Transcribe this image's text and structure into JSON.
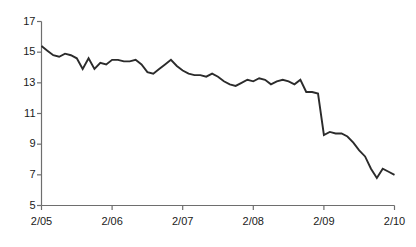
{
  "chart_data": {
    "type": "line",
    "title": "",
    "subtitle": "",
    "xlabel": "",
    "ylabel": "",
    "grid": false,
    "legend": false,
    "legend_position": "none",
    "line_color": "#2b2b2b",
    "axis_color": "#6e6e6e",
    "background_color": "#ffffff",
    "ylim": [
      5,
      17
    ],
    "ytick_labels": [
      "17",
      "15",
      "13",
      "11",
      "9",
      "7",
      "5"
    ],
    "yticks": [
      17,
      15,
      13,
      11,
      9,
      7,
      5
    ],
    "xtick_labels": [
      "2/05",
      "2/06",
      "2/07",
      "2/08",
      "2/09",
      "2/10"
    ],
    "xticks": [
      0,
      12,
      24,
      36,
      48,
      60
    ],
    "xlim": [
      0,
      60
    ],
    "series": [
      {
        "name": "value",
        "x": [
          0,
          1,
          2,
          3,
          4,
          5,
          6,
          7,
          8,
          9,
          10,
          11,
          12,
          13,
          14,
          15,
          16,
          17,
          18,
          19,
          20,
          21,
          22,
          23,
          24,
          25,
          26,
          27,
          28,
          29,
          30,
          31,
          32,
          33,
          34,
          35,
          36,
          37,
          38,
          39,
          40,
          41,
          42,
          43,
          44,
          45,
          46,
          47,
          48,
          49,
          50,
          51,
          52,
          53,
          54,
          55,
          56,
          57,
          58,
          59,
          60
        ],
        "values": [
          15.4,
          15.1,
          14.8,
          14.7,
          14.9,
          14.8,
          14.6,
          13.9,
          14.6,
          13.9,
          14.3,
          14.2,
          14.5,
          14.5,
          14.4,
          14.4,
          14.5,
          14.2,
          13.7,
          13.6,
          13.9,
          14.2,
          14.5,
          14.1,
          13.8,
          13.6,
          13.5,
          13.5,
          13.4,
          13.6,
          13.4,
          13.1,
          12.9,
          12.8,
          13.0,
          13.2,
          13.1,
          13.3,
          13.2,
          12.9,
          13.1,
          13.2,
          13.1,
          12.9,
          13.2,
          12.4,
          12.4,
          12.3,
          9.6,
          9.8,
          9.7,
          9.7,
          9.5,
          9.1,
          8.6,
          8.2,
          7.4,
          6.8,
          7.4,
          7.2,
          7.0
        ]
      }
    ]
  },
  "axes": {
    "y_axis_name": "value-axis",
    "x_axis_name": "date-axis"
  }
}
